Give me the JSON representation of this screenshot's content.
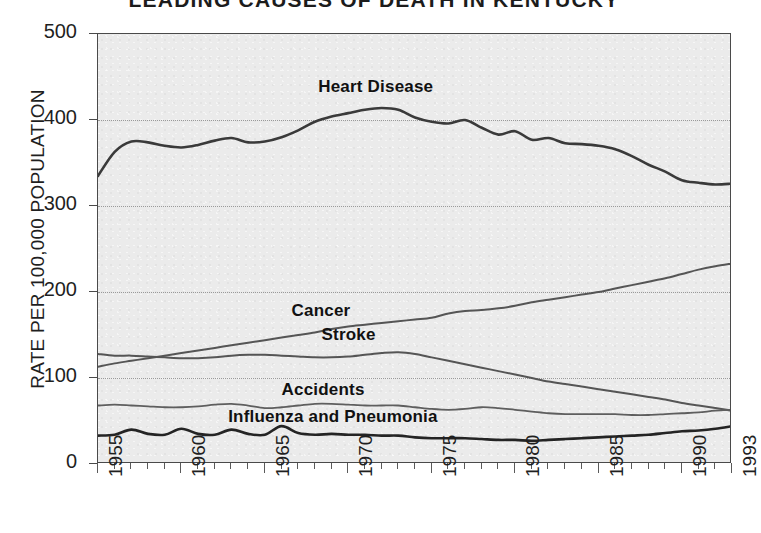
{
  "chart_data": {
    "type": "line",
    "title": "LEADING CAUSES OF DEATH IN KENTUCKY",
    "xlabel": "",
    "ylabel": "RATE PER 100,000 POPULATION",
    "xlim": [
      1955,
      1993
    ],
    "ylim": [
      0,
      500
    ],
    "yticks": [
      0,
      100,
      200,
      300,
      400,
      500
    ],
    "xticks": [
      1955,
      1960,
      1965,
      1970,
      1975,
      1980,
      1985,
      1990,
      1993
    ],
    "grid": true,
    "legend_position": "inline-labels",
    "x": [
      1955,
      1956,
      1957,
      1958,
      1959,
      1960,
      1961,
      1962,
      1963,
      1964,
      1965,
      1966,
      1967,
      1968,
      1969,
      1970,
      1971,
      1972,
      1973,
      1974,
      1975,
      1976,
      1977,
      1978,
      1979,
      1980,
      1981,
      1982,
      1983,
      1984,
      1985,
      1986,
      1987,
      1988,
      1989,
      1990,
      1991,
      1992,
      1993
    ],
    "series": [
      {
        "name": "Heart Disease",
        "color": "#3a3a3a",
        "width": 2.6,
        "label_x": 1968.2,
        "label_y": 438,
        "values": [
          335,
          363,
          375,
          374,
          370,
          368,
          371,
          376,
          379,
          374,
          375,
          380,
          388,
          398,
          404,
          408,
          412,
          414,
          412,
          403,
          398,
          396,
          400,
          391,
          383,
          387,
          377,
          379,
          373,
          372,
          370,
          366,
          358,
          348,
          340,
          330,
          327,
          325,
          326
        ]
      },
      {
        "name": "Cancer",
        "color": "#555555",
        "width": 2.0,
        "label_x": 1966.6,
        "label_y": 178,
        "values": [
          113,
          117,
          120,
          123,
          126,
          129,
          132,
          135,
          138,
          141,
          144,
          147,
          150,
          153,
          157,
          160,
          162,
          164,
          166,
          168,
          170,
          175,
          178,
          179,
          181,
          184,
          188,
          191,
          194,
          197,
          200,
          204,
          208,
          212,
          216,
          221,
          226,
          230,
          233
        ]
      },
      {
        "name": "Stroke",
        "color": "#555555",
        "width": 2.0,
        "label_x": 1968.4,
        "label_y": 150,
        "values": [
          128,
          126,
          126,
          125,
          124,
          123,
          123,
          124,
          126,
          127,
          127,
          126,
          125,
          124,
          124,
          125,
          127,
          129,
          130,
          128,
          124,
          120,
          116,
          112,
          108,
          104,
          100,
          96,
          93,
          90,
          87,
          84,
          81,
          78,
          75,
          71,
          68,
          65,
          62
        ]
      },
      {
        "name": "Accidents",
        "color": "#5e5e5e",
        "width": 1.8,
        "label_x": 1966.0,
        "label_y": 86,
        "values": [
          68,
          69,
          68,
          67,
          66,
          66,
          67,
          69,
          70,
          68,
          65,
          66,
          68,
          70,
          70,
          69,
          68,
          68,
          68,
          66,
          64,
          63,
          64,
          66,
          65,
          63,
          61,
          59,
          58,
          58,
          58,
          58,
          57,
          57,
          58,
          59,
          60,
          62,
          63
        ]
      },
      {
        "name": "Influenza and Pneumonia",
        "color": "#242424",
        "width": 2.6,
        "label_x": 1962.8,
        "label_y": 55,
        "values": [
          33,
          34,
          40,
          35,
          34,
          41,
          35,
          34,
          40,
          35,
          34,
          44,
          36,
          34,
          35,
          34,
          34,
          33,
          33,
          31,
          30,
          30,
          30,
          29,
          28,
          28,
          27,
          28,
          29,
          30,
          31,
          32,
          33,
          34,
          36,
          38,
          39,
          41,
          44
        ]
      }
    ]
  }
}
